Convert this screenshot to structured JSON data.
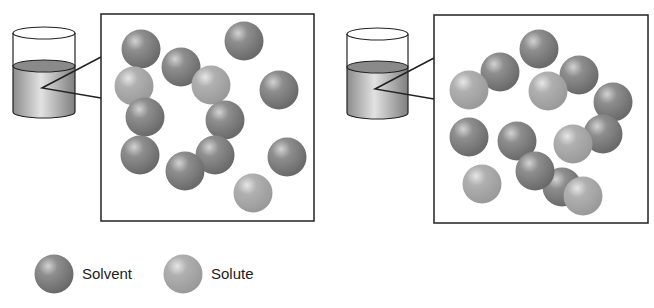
{
  "colors": {
    "solvent": "#7a7a7a",
    "solvent_highlight": "#d2d2d2",
    "solute": "#a9a9a9",
    "solute_highlight": "#e6e6e6",
    "outline": "#222222"
  },
  "panels": [
    {
      "name": "left",
      "beaker": {
        "x": 13,
        "w": 62,
        "top_y": 33,
        "liquid_y": 66,
        "bottom_y": 112,
        "pointer": [
          42,
          88
        ]
      },
      "box": {
        "x": 101,
        "y": 14,
        "w": 213,
        "h": 207
      },
      "particles": [
        {
          "type": "solvent",
          "x": 141,
          "y": 49
        },
        {
          "type": "solvent",
          "x": 244,
          "y": 41
        },
        {
          "type": "solvent",
          "x": 181,
          "y": 67
        },
        {
          "type": "solute",
          "x": 134,
          "y": 86
        },
        {
          "type": "solute",
          "x": 211,
          "y": 85
        },
        {
          "type": "solvent",
          "x": 279,
          "y": 90
        },
        {
          "type": "solvent",
          "x": 145,
          "y": 117
        },
        {
          "type": "solvent",
          "x": 225,
          "y": 120
        },
        {
          "type": "solvent",
          "x": 140,
          "y": 155
        },
        {
          "type": "solvent",
          "x": 215,
          "y": 155
        },
        {
          "type": "solvent",
          "x": 185,
          "y": 171
        },
        {
          "type": "solvent",
          "x": 287,
          "y": 157
        },
        {
          "type": "solute",
          "x": 253,
          "y": 193
        }
      ]
    },
    {
      "name": "right",
      "beaker": {
        "x": 347,
        "w": 61,
        "top_y": 34,
        "liquid_y": 67,
        "bottom_y": 113,
        "pointer": [
          375,
          89
        ]
      },
      "box": {
        "x": 434,
        "y": 15,
        "w": 214,
        "h": 208
      },
      "particles": [
        {
          "type": "solvent",
          "x": 539,
          "y": 49
        },
        {
          "type": "solvent",
          "x": 500,
          "y": 72
        },
        {
          "type": "solute",
          "x": 469,
          "y": 90
        },
        {
          "type": "solvent",
          "x": 579,
          "y": 75
        },
        {
          "type": "solute",
          "x": 548,
          "y": 91
        },
        {
          "type": "solvent",
          "x": 613,
          "y": 102
        },
        {
          "type": "solvent",
          "x": 469,
          "y": 137
        },
        {
          "type": "solvent",
          "x": 603,
          "y": 134
        },
        {
          "type": "solute",
          "x": 573,
          "y": 144
        },
        {
          "type": "solvent",
          "x": 517,
          "y": 141
        },
        {
          "type": "solvent",
          "x": 562,
          "y": 187
        },
        {
          "type": "solvent",
          "x": 535,
          "y": 171
        },
        {
          "type": "solute",
          "x": 583,
          "y": 196
        },
        {
          "type": "solute",
          "x": 482,
          "y": 184
        }
      ]
    }
  ],
  "legend": {
    "items": [
      {
        "type": "solvent",
        "label": "Solvent",
        "x": 54,
        "y": 274
      },
      {
        "type": "solute",
        "label": "Solute",
        "x": 183,
        "y": 274
      }
    ]
  },
  "particle_radius": 19.5
}
